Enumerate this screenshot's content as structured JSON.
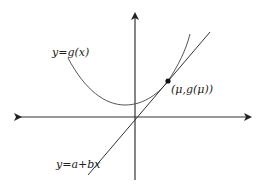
{
  "diagram": {
    "type": "function-with-tangent-line",
    "labels": {
      "curve": "y=g(x)",
      "line": "y=a+bx",
      "point": "(μ,g(μ))"
    },
    "colors": {
      "axis": "#333333",
      "curve": "#555555",
      "line": "#333333",
      "point": "#111111",
      "background": "#ffffff"
    },
    "elements": [
      {
        "name": "x-axis",
        "description": "horizontal axis with arrows at both ends"
      },
      {
        "name": "y-axis",
        "description": "vertical axis with arrow at top"
      },
      {
        "name": "curve",
        "description": "convex curve y=g(x) with minimum slightly left of y-axis"
      },
      {
        "name": "tangent-line",
        "description": "straight line y=a+bx tangent to curve at (μ,g(μ))"
      },
      {
        "name": "tangent-point",
        "description": "filled dot at the point of tangency"
      }
    ]
  }
}
